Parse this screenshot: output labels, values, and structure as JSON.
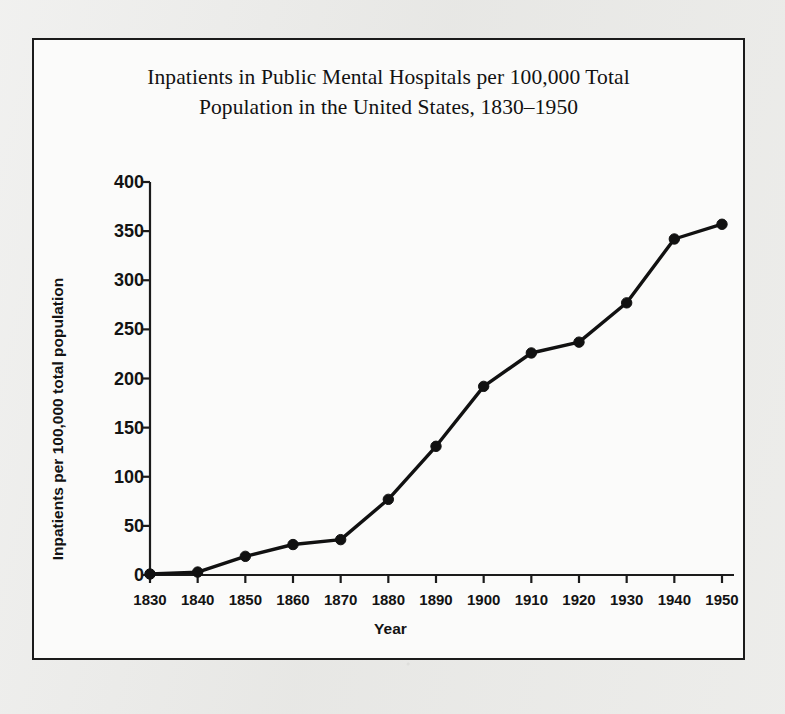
{
  "figure": {
    "title_line1": "Inpatients in Public Mental Hospitals per 100,000 Total",
    "title_line2": "Population in the United States, 1830–1950",
    "border_color": "#1b1b1b",
    "paper_color": "#fbfbfa",
    "page_color": "#e9e9e7"
  },
  "chart_data": {
    "type": "line",
    "title": "Inpatients in Public Mental Hospitals per 100,000 Total Population in the United States, 1830–1950",
    "xlabel": "Year",
    "ylabel": "Inpatients per 100,000 total population",
    "x": [
      1830,
      1840,
      1850,
      1860,
      1870,
      1880,
      1890,
      1900,
      1910,
      1920,
      1930,
      1940,
      1950
    ],
    "values": [
      1,
      3,
      19,
      31,
      36,
      77,
      131,
      192,
      226,
      237,
      277,
      342,
      357
    ],
    "xticklabels": [
      "1830",
      "1840",
      "1850",
      "1860",
      "1870",
      "1880",
      "1890",
      "1900",
      "1910",
      "1920",
      "1930",
      "1940",
      "1950"
    ],
    "yticks": [
      0,
      50,
      100,
      150,
      200,
      250,
      300,
      350,
      400
    ],
    "yticklabels": [
      "0",
      "50",
      "100",
      "150",
      "200",
      "250",
      "300",
      "350",
      "400"
    ],
    "xlim": [
      1830,
      1950
    ],
    "ylim": [
      0,
      400
    ],
    "grid": false,
    "legend": null,
    "line_color": "#111111",
    "marker": "circle",
    "marker_color": "#111111"
  }
}
